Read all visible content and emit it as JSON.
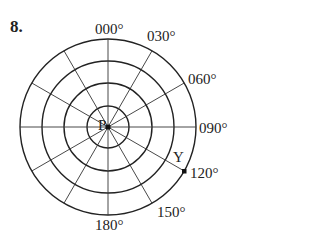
{
  "question_number": "8.",
  "center_label": "P",
  "point_label": "Y",
  "bearing_labels": {
    "b000": "000°",
    "b030": "030°",
    "b060": "060°",
    "b090": "090°",
    "b120": "120°",
    "b150": "150°",
    "b180": "180°"
  },
  "diagram": {
    "type": "polar-grid",
    "rings": 4,
    "spokes_every_degrees": 30,
    "point_Y": {
      "bearing_deg": 120,
      "ring": 4
    },
    "line_color": "#222222"
  }
}
